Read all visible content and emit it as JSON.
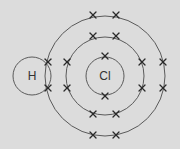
{
  "diagram": {
    "type": "dot-and-cross",
    "background": "#dcdcdc",
    "line_color": "#5a5a5a",
    "atoms": [
      {
        "symbol": "H",
        "cx": 32,
        "cy": 76,
        "r": 19
      },
      {
        "symbol": "Cl",
        "cx": 105,
        "cy": 76,
        "r": 19
      }
    ],
    "shells": [
      {
        "name": "cl-inner-shell",
        "cx": 105,
        "cy": 76,
        "r": 19
      },
      {
        "name": "cl-middle-shell",
        "cx": 105,
        "cy": 76,
        "r": 39
      },
      {
        "name": "cl-outer-shell",
        "cx": 105,
        "cy": 76,
        "r": 60
      }
    ],
    "electrons": [
      {
        "shell": "inner",
        "x": 105,
        "y": 56
      },
      {
        "shell": "inner",
        "x": 105,
        "y": 96
      },
      {
        "shell": "middle",
        "x": 93,
        "y": 36
      },
      {
        "shell": "middle",
        "x": 116,
        "y": 36
      },
      {
        "shell": "middle",
        "x": 67,
        "y": 62
      },
      {
        "shell": "middle",
        "x": 67,
        "y": 88
      },
      {
        "shell": "middle",
        "x": 142,
        "y": 62
      },
      {
        "shell": "middle",
        "x": 142,
        "y": 88
      },
      {
        "shell": "middle",
        "x": 93,
        "y": 114
      },
      {
        "shell": "middle",
        "x": 116,
        "y": 114
      },
      {
        "shell": "outer",
        "x": 93,
        "y": 15
      },
      {
        "shell": "outer",
        "x": 116,
        "y": 15
      },
      {
        "shell": "outer",
        "x": 163,
        "y": 62
      },
      {
        "shell": "outer",
        "x": 163,
        "y": 88
      },
      {
        "shell": "outer",
        "x": 93,
        "y": 135
      },
      {
        "shell": "outer",
        "x": 116,
        "y": 135
      },
      {
        "shell": "shared",
        "x": 48,
        "y": 62
      },
      {
        "shell": "shared",
        "x": 48,
        "y": 88
      }
    ]
  }
}
